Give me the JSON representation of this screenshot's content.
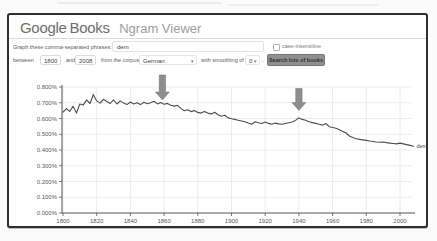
{
  "header": {
    "logo_google": "Google",
    "logo_books": "Books",
    "title": "Ngram Viewer"
  },
  "controls": {
    "phrases_label": "Graph these comma-separated phrases:",
    "phrases_value": "dem",
    "case_insensitive_label": "case-insensitive",
    "between_label": "between",
    "year_start": "1800",
    "and_label": "and",
    "year_end": "2008",
    "corpus_label": "from the corpus",
    "corpus_value": "German",
    "smoothing_label": "with smoothing of",
    "smoothing_value": "0",
    "period_label": ".",
    "dropdown_arrow": "▾",
    "search_button": "Search lots of books"
  },
  "colors": {
    "frame_border": "#2f2f2f",
    "line": "#4d4d4d",
    "grid": "#ececec",
    "axis": "#555555",
    "tick_text": "#5a5a5a",
    "arrow": "#8d8d8d",
    "button_bg": "#8f8f8f"
  },
  "chart_data": {
    "type": "line",
    "title": "",
    "xlabel": "",
    "ylabel": "",
    "xlim": [
      1800,
      2008
    ],
    "ylim_percent": [
      0,
      0.8
    ],
    "grid": true,
    "x_ticks": [
      1800,
      1820,
      1840,
      1860,
      1880,
      1900,
      1920,
      1940,
      1960,
      1980,
      2000
    ],
    "y_tick_labels": [
      "0.000%",
      "0.100%",
      "0.200%",
      "0.300%",
      "0.400%",
      "0.500%",
      "0.600%",
      "0.700%",
      "0.800%"
    ],
    "series": [
      {
        "name": "dem",
        "end_label": "dem",
        "x_start": 1800,
        "x_step": 2,
        "values_percent": [
          0.64,
          0.662,
          0.645,
          0.678,
          0.634,
          0.692,
          0.685,
          0.718,
          0.695,
          0.752,
          0.712,
          0.698,
          0.722,
          0.708,
          0.695,
          0.718,
          0.692,
          0.712,
          0.698,
          0.688,
          0.705,
          0.692,
          0.7,
          0.688,
          0.703,
          0.694,
          0.7,
          0.71,
          0.693,
          0.701,
          0.69,
          0.696,
          0.684,
          0.679,
          0.684,
          0.664,
          0.649,
          0.655,
          0.644,
          0.65,
          0.639,
          0.634,
          0.645,
          0.634,
          0.629,
          0.64,
          0.624,
          0.614,
          0.62,
          0.604,
          0.599,
          0.594,
          0.589,
          0.584,
          0.579,
          0.571,
          0.564,
          0.579,
          0.573,
          0.568,
          0.577,
          0.569,
          0.563,
          0.571,
          0.566,
          0.563,
          0.568,
          0.573,
          0.578,
          0.588,
          0.604,
          0.594,
          0.589,
          0.579,
          0.574,
          0.569,
          0.563,
          0.558,
          0.568,
          0.548,
          0.543,
          0.538,
          0.528,
          0.518,
          0.508,
          0.489,
          0.479,
          0.471,
          0.467,
          0.464,
          0.461,
          0.457,
          0.454,
          0.451,
          0.449,
          0.451,
          0.447,
          0.444,
          0.441,
          0.439,
          0.444,
          0.439,
          0.434,
          0.429,
          0.424
        ]
      }
    ],
    "annotations": [
      {
        "type": "down-arrow",
        "year": 1859,
        "points_at_percent": 0.705,
        "size": 25
      },
      {
        "type": "down-arrow",
        "year": 1940,
        "points_at_percent": 0.638,
        "size": 22
      }
    ]
  }
}
